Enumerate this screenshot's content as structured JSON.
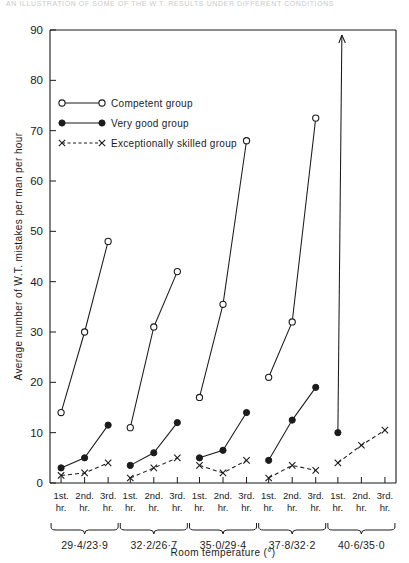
{
  "top_fragment": "AN ILLUSTRATION OF SOME OF THE W.T. RESULTS UNDER DIFFERENT CONDITIONS",
  "chart_data": {
    "type": "line",
    "title": "",
    "xlabel": "Room temperature  (°)",
    "ylabel": "Average number of W.T. mistakes per man per hour",
    "ylim": [
      0,
      90
    ],
    "ytick_values": [
      0,
      10,
      20,
      30,
      40,
      50,
      60,
      70,
      80,
      90
    ],
    "ytick_labels": [
      "0",
      "10",
      "20",
      "30",
      "40",
      "50",
      "60",
      "70",
      "80",
      "90"
    ],
    "grid": false,
    "legend_position": "upper-left-inside",
    "hour_labels": [
      "1st.\nhr.",
      "2nd.\nhr.",
      "3rd.\nhr."
    ],
    "hour_labels_line1": [
      "1st.",
      "2nd.",
      "3rd."
    ],
    "hour_labels_line2": [
      "hr.",
      "hr.",
      "hr."
    ],
    "groups": [
      {
        "label": "29·4/23·9"
      },
      {
        "label": "32·2/26·7"
      },
      {
        "label": "35·0/29·4"
      },
      {
        "label": "37·8/32·2"
      },
      {
        "label": "40·6/35·0"
      }
    ],
    "series": [
      {
        "name": "Competent group",
        "marker": "open-circle",
        "line": "solid",
        "color": "#1b1b1b",
        "values_by_group": [
          [
            14,
            30,
            48
          ],
          [
            11,
            31,
            42
          ],
          [
            17,
            35.5,
            68
          ],
          [
            21,
            32,
            72.5
          ],
          [
            null,
            null,
            null
          ]
        ]
      },
      {
        "name": "Very good group",
        "marker": "filled-circle",
        "line": "solid",
        "color": "#1b1b1b",
        "values_by_group": [
          [
            3,
            5,
            11.5
          ],
          [
            3.5,
            6,
            12
          ],
          [
            5,
            6.5,
            14
          ],
          [
            4.5,
            12.5,
            19
          ],
          [
            10,
            null,
            null
          ]
        ],
        "off_scale_arrow": {
          "group": 4,
          "hour": 0,
          "from": 10,
          "to_top": 89,
          "note": "arrow rises off scale"
        }
      },
      {
        "name": "Exceptionally skilled group",
        "marker": "x",
        "line": "dashed",
        "color": "#1b1b1b",
        "values_by_group": [
          [
            1.5,
            2,
            4
          ],
          [
            1,
            3,
            5
          ],
          [
            3.5,
            2,
            4.5
          ],
          [
            1,
            3.5,
            2.5
          ],
          [
            4,
            7.5,
            10.5
          ]
        ]
      }
    ]
  },
  "legend": {
    "items": [
      {
        "label": "Competent group"
      },
      {
        "label": "Very good group"
      },
      {
        "label": "Exceptionally skilled group"
      }
    ]
  }
}
